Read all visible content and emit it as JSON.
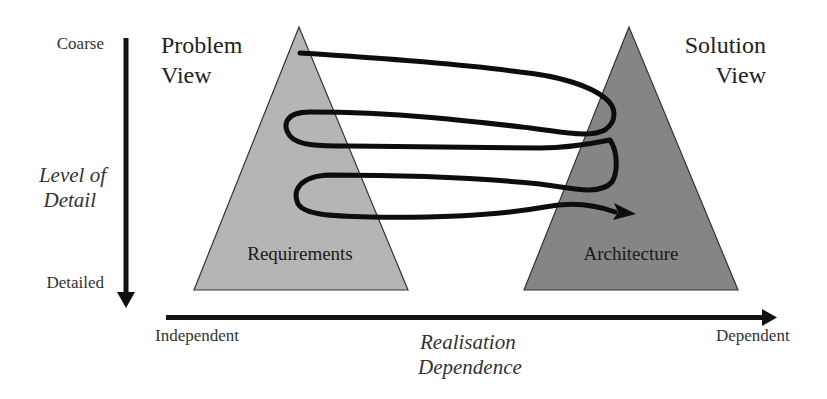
{
  "diagram": {
    "type": "twin-peaks",
    "colors": {
      "background": "#ffffff",
      "problem_triangle": "#b5b5b5",
      "solution_triangle": "#858585",
      "triangle_stroke": "#333333",
      "arrows": "#111111",
      "spiral": "#0d0d0d"
    },
    "vertical_axis": {
      "title_line1": "Level of",
      "title_line2": "Detail",
      "top_label": "Coarse",
      "bottom_label": "Detailed",
      "direction": "down"
    },
    "horizontal_axis": {
      "title_line1": "Realisation",
      "title_line2": "Dependence",
      "left_label": "Independent",
      "right_label": "Dependent",
      "direction": "right"
    },
    "problem_view": {
      "title_line1": "Problem",
      "title_line2": "View",
      "triangle_label": "Requirements"
    },
    "solution_view": {
      "title_line1": "Solution",
      "title_line2": "View",
      "triangle_label": "Architecture"
    },
    "spiral": {
      "description": "Iterative spiral path weaving between Problem View and Solution View, progressing from coarse to detailed",
      "loops": 3,
      "ends_with": "arrowhead"
    }
  }
}
